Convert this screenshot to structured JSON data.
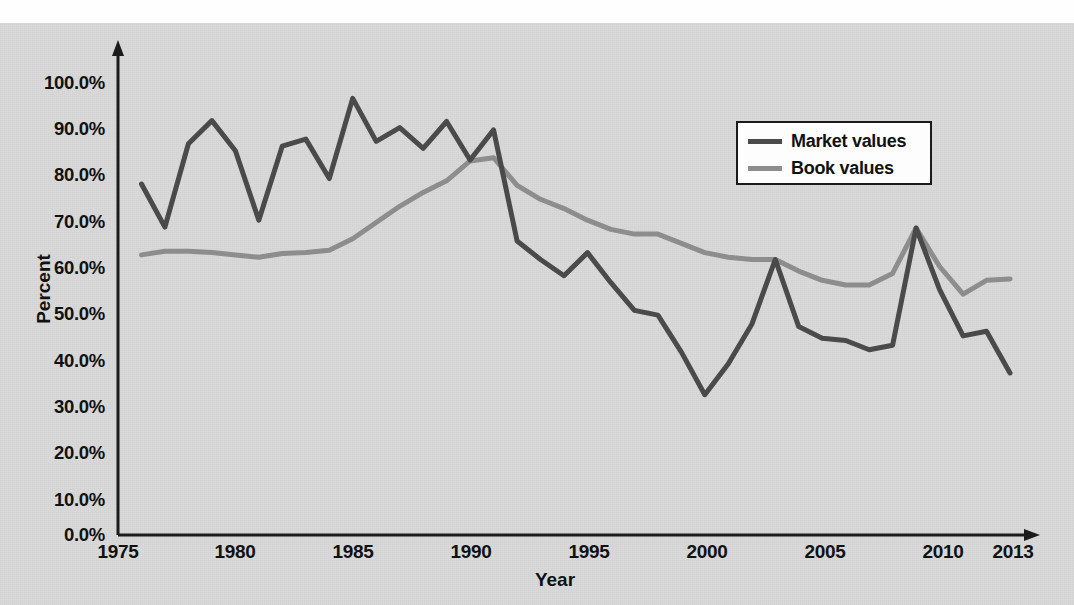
{
  "figure": {
    "top_fragment": "",
    "background_color": "#d9d9d9",
    "plate_color": "#d9d9d9"
  },
  "axes": {
    "y_title": "Percent",
    "x_title": "Year",
    "y_ticks": [
      "0.0%",
      "10.0%",
      "20.0%",
      "30.0%",
      "40.0%",
      "50.0%",
      "60.0%",
      "70.0%",
      "80.0%",
      "90.0%",
      "100.0%"
    ],
    "x_ticks": [
      "1975",
      "1980",
      "1985",
      "1990",
      "1995",
      "2000",
      "2005",
      "2010",
      "2013"
    ]
  },
  "legend": {
    "position": "top-right",
    "items": [
      {
        "label": "Market values",
        "color": "#4a4a4a"
      },
      {
        "label": "Book values",
        "color": "#8d8d8d"
      }
    ]
  },
  "chart_data": {
    "type": "line",
    "title": "",
    "subtitle": "",
    "xlabel": "Year",
    "ylabel": "Percent",
    "xlim": [
      1975,
      2013
    ],
    "ylim": [
      0,
      100
    ],
    "grid": false,
    "legend_position": "top-right",
    "x": [
      1976,
      1977,
      1978,
      1979,
      1980,
      1981,
      1982,
      1983,
      1984,
      1985,
      1986,
      1987,
      1988,
      1989,
      1990,
      1991,
      1992,
      1993,
      1994,
      1995,
      1996,
      1997,
      1998,
      1999,
      2000,
      2001,
      2002,
      2003,
      2004,
      2005,
      2006,
      2007,
      2008,
      2009,
      2010,
      2011,
      2012,
      2013
    ],
    "series": [
      {
        "name": "Market values",
        "color": "#4a4a4a",
        "values": [
          75.8,
          66.5,
          84.5,
          89.5,
          83.0,
          68.0,
          84.0,
          85.5,
          77.0,
          94.3,
          85.0,
          88.0,
          83.5,
          89.3,
          81.0,
          87.5,
          63.5,
          59.5,
          56.0,
          61.0,
          54.5,
          48.5,
          47.5,
          39.5,
          30.3,
          37.0,
          45.5,
          59.5,
          45.0,
          42.5,
          42.0,
          40.0,
          41.0,
          66.3,
          53.0,
          43.0,
          44.0,
          35.0
        ]
      },
      {
        "name": "Book values",
        "color": "#8d8d8d",
        "values": [
          60.5,
          61.3,
          61.3,
          61.0,
          60.5,
          60.0,
          60.8,
          61.0,
          61.5,
          64.0,
          67.5,
          71.0,
          74.0,
          76.5,
          80.8,
          81.5,
          75.5,
          72.5,
          70.5,
          68.0,
          66.0,
          65.0,
          65.0,
          63.0,
          61.0,
          60.0,
          59.5,
          59.5,
          57.0,
          55.0,
          54.0,
          54.0,
          56.5,
          66.3,
          58.0,
          52.0,
          55.0,
          55.3
        ]
      }
    ]
  }
}
